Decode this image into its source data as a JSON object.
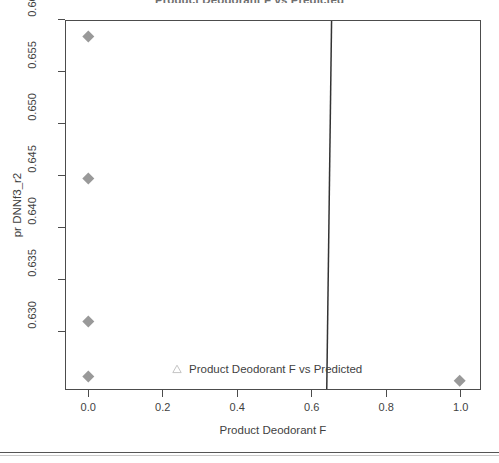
{
  "chart_data": {
    "type": "scatter",
    "title": "Product Deodorant F vs Predicted",
    "xlabel": "Product Deodorant F",
    "ylabel": "pr DNNf3_r2",
    "xlim": [
      -0.06,
      1.06
    ],
    "ylim": [
      0.6258,
      0.6615
    ],
    "xticks": [
      "0.0",
      "0.2",
      "0.4",
      "0.6",
      "0.8",
      "1.0"
    ],
    "xtick_values": [
      0.0,
      0.2,
      0.4,
      0.6,
      0.8,
      1.0
    ],
    "yticks": [
      "0.630",
      "0.635",
      "0.640",
      "0.645",
      "0.650",
      "0.655",
      "0.660"
    ],
    "ytick_values": [
      0.63,
      0.635,
      0.64,
      0.645,
      0.65,
      0.655,
      0.66
    ],
    "grid": false,
    "legend_position": "bottom-center",
    "series": [
      {
        "name": "Product Deodorant F vs Predicted",
        "marker": "diamond",
        "marker_color": "#999999",
        "legend_marker": "triangle",
        "points": [
          {
            "x": 0.0,
            "y": 0.66
          },
          {
            "x": 0.0,
            "y": 0.6463
          },
          {
            "x": 0.0,
            "y": 0.6325
          },
          {
            "x": 0.0,
            "y": 0.6272
          },
          {
            "x": 1.0,
            "y": 0.6268
          }
        ]
      },
      {
        "name": "fit-line",
        "type": "line",
        "color": "#333333",
        "x": [
          0.655,
          0.642
        ],
        "y": [
          0.66153,
          0.6258
        ]
      }
    ]
  },
  "colors": {
    "marker": "#999999",
    "axis": "#4c4c4c",
    "text": "#3f3f3f",
    "title": "#6f6f6f",
    "line": "#333333",
    "legend_marker_stroke": "#cccccc",
    "footer_rule": "#555555"
  },
  "axes": {
    "y_title": "pr DNNf3_r2",
    "x_title": "Product Deodorant F",
    "y_tick_labels": [
      "0.630",
      "0.635",
      "0.640",
      "0.645",
      "0.650",
      "0.655",
      "0.660"
    ],
    "x_tick_labels": [
      "0.0",
      "0.2",
      "0.4",
      "0.6",
      "0.8",
      "1.0"
    ]
  },
  "legend": {
    "label": "Product Deodorant F vs Predicted",
    "marker_icon": "triangle-up-icon"
  },
  "title": {
    "text": "Product Deodorant F vs Predicted"
  }
}
